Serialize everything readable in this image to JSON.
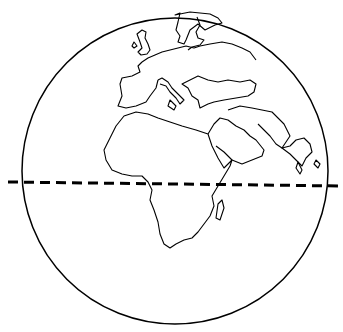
{
  "figure": {
    "globe": {
      "cx": 175,
      "cy": 172,
      "r": 153,
      "stroke": "#000000"
    },
    "equator": {
      "style": "dashed",
      "y_left": 182,
      "y_right": 186,
      "stroke": "#000000"
    },
    "regions": [
      "Europe",
      "Africa",
      "Middle East",
      "India",
      "Madagascar"
    ]
  }
}
